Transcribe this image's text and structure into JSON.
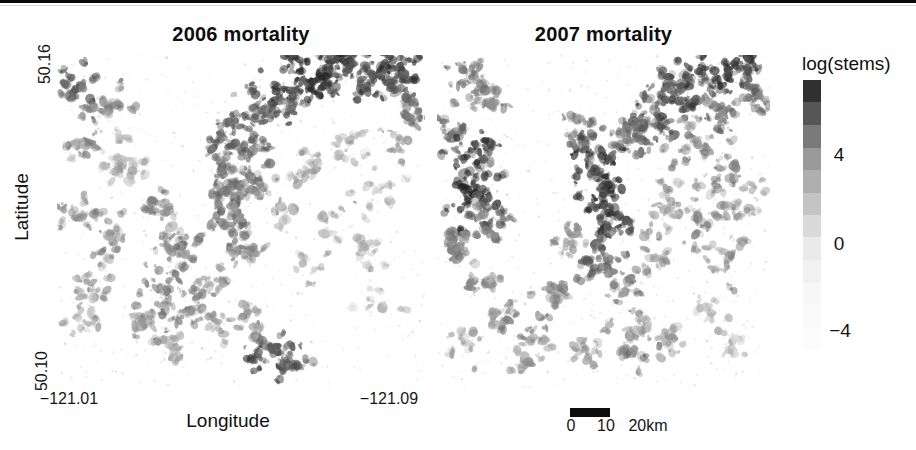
{
  "figure": {
    "panels": [
      {
        "title": "2006 mortality"
      },
      {
        "title": "2007 mortality"
      }
    ],
    "axes": {
      "y_label": "Latitude",
      "y_ticks": [
        {
          "label": "50.16"
        },
        {
          "label": "50.10"
        }
      ],
      "x_label": "Longitude",
      "x_ticks": [
        {
          "label": "−121.01"
        },
        {
          "label": "−121.09"
        }
      ]
    },
    "colorbar": {
      "title": "log(stems)",
      "ticks": [
        {
          "label": "4"
        },
        {
          "label": "0"
        },
        {
          "label": "−4"
        }
      ],
      "dark_color": "#282828",
      "light_color": "#fdfdfd"
    },
    "scalebar": {
      "labels": [
        {
          "text": "0"
        },
        {
          "text": "10"
        },
        {
          "text": "20km"
        }
      ],
      "bar_color": "#0d0d0d"
    },
    "top_rule_color": "#0b0b0b"
  },
  "chart_data": {
    "type": "heatmap",
    "subtype": "grayscale-raster-map-pair",
    "xlabel": "Longitude",
    "ylabel": "Latitude",
    "x_range": [
      -121.01,
      -121.09
    ],
    "y_range": [
      50.1,
      50.16
    ],
    "grid": false,
    "legend_position": "right",
    "colorbar": {
      "label": "log(stems)",
      "tick_values": [
        4,
        0,
        -4
      ],
      "value_range": [
        -5,
        7.5
      ],
      "high_is_dark": true,
      "steps": 12,
      "gradient_anchors": [
        [
          0,
          30
        ],
        [
          0.274,
          150
        ],
        [
          0.6,
          232
        ],
        [
          0.8,
          248
        ],
        [
          1,
          253
        ]
      ]
    },
    "scalebar": {
      "units": "km",
      "ticks": [
        0,
        10,
        20
      ],
      "filled_segment_km": [
        0,
        10
      ]
    },
    "panels": [
      {
        "title": "2006 mortality",
        "clusters": [
          [
            0.47,
            0.4,
            30,
            14,
            0.55
          ],
          [
            0.46,
            0.3,
            26,
            12,
            0.6
          ],
          [
            0.5,
            0.22,
            24,
            12,
            0.6
          ],
          [
            0.56,
            0.16,
            26,
            12,
            0.65
          ],
          [
            0.62,
            0.1,
            30,
            13,
            0.75
          ],
          [
            0.7,
            0.06,
            34,
            13,
            0.85
          ],
          [
            0.78,
            0.04,
            30,
            12,
            0.8
          ],
          [
            0.86,
            0.08,
            26,
            12,
            0.7
          ],
          [
            0.93,
            0.05,
            20,
            10,
            0.75
          ],
          [
            0.97,
            0.17,
            16,
            9,
            0.6
          ],
          [
            0.47,
            0.5,
            22,
            11,
            0.55
          ],
          [
            0.5,
            0.58,
            18,
            10,
            0.5
          ],
          [
            0.53,
            0.38,
            16,
            9,
            0.5
          ],
          [
            0.04,
            0.1,
            22,
            11,
            0.65
          ],
          [
            0.13,
            0.16,
            18,
            11,
            0.5
          ],
          [
            0.07,
            0.27,
            16,
            10,
            0.45
          ],
          [
            0.16,
            0.31,
            26,
            16,
            0.33
          ],
          [
            0.05,
            0.47,
            16,
            10,
            0.45
          ],
          [
            0.14,
            0.55,
            18,
            11,
            0.45
          ],
          [
            0.1,
            0.68,
            14,
            10,
            0.4
          ],
          [
            0.06,
            0.8,
            12,
            9,
            0.35
          ],
          [
            0.28,
            0.47,
            18,
            11,
            0.45
          ],
          [
            0.33,
            0.57,
            20,
            11,
            0.5
          ],
          [
            0.3,
            0.68,
            20,
            11,
            0.5
          ],
          [
            0.36,
            0.76,
            18,
            10,
            0.5
          ],
          [
            0.24,
            0.8,
            16,
            10,
            0.45
          ],
          [
            0.3,
            0.88,
            14,
            9,
            0.4
          ],
          [
            0.41,
            0.68,
            14,
            9,
            0.45
          ],
          [
            0.44,
            0.82,
            12,
            9,
            0.4
          ],
          [
            0.56,
            0.88,
            22,
            11,
            0.7
          ],
          [
            0.63,
            0.92,
            18,
            9,
            0.65
          ],
          [
            0.52,
            0.78,
            12,
            9,
            0.45
          ],
          [
            0.8,
            0.3,
            12,
            12,
            0.3
          ],
          [
            0.88,
            0.42,
            12,
            12,
            0.3
          ],
          [
            0.85,
            0.58,
            10,
            11,
            0.3
          ],
          [
            0.93,
            0.27,
            10,
            9,
            0.35
          ],
          [
            0.75,
            0.5,
            10,
            10,
            0.35
          ],
          [
            0.68,
            0.35,
            12,
            10,
            0.35
          ],
          [
            0.6,
            0.47,
            10,
            9,
            0.35
          ],
          [
            0.87,
            0.75,
            8,
            9,
            0.25
          ],
          [
            0.7,
            0.65,
            8,
            9,
            0.3
          ]
        ]
      },
      {
        "title": "2007 mortality",
        "clusters": [
          [
            0.08,
            0.08,
            20,
            11,
            0.55
          ],
          [
            0.16,
            0.12,
            16,
            10,
            0.5
          ],
          [
            0.04,
            0.22,
            18,
            10,
            0.55
          ],
          [
            0.13,
            0.3,
            28,
            13,
            0.75
          ],
          [
            0.1,
            0.42,
            30,
            13,
            0.8
          ],
          [
            0.16,
            0.5,
            22,
            11,
            0.6
          ],
          [
            0.06,
            0.58,
            18,
            10,
            0.55
          ],
          [
            0.12,
            0.68,
            16,
            10,
            0.45
          ],
          [
            0.2,
            0.78,
            14,
            9,
            0.45
          ],
          [
            0.08,
            0.88,
            10,
            8,
            0.35
          ],
          [
            0.44,
            0.22,
            20,
            11,
            0.6
          ],
          [
            0.47,
            0.32,
            26,
            12,
            0.75
          ],
          [
            0.5,
            0.42,
            26,
            12,
            0.8
          ],
          [
            0.52,
            0.52,
            24,
            11,
            0.75
          ],
          [
            0.48,
            0.62,
            20,
            10,
            0.6
          ],
          [
            0.55,
            0.7,
            16,
            10,
            0.5
          ],
          [
            0.4,
            0.55,
            14,
            9,
            0.45
          ],
          [
            0.58,
            0.25,
            22,
            12,
            0.6
          ],
          [
            0.65,
            0.18,
            26,
            12,
            0.65
          ],
          [
            0.72,
            0.12,
            28,
            12,
            0.7
          ],
          [
            0.8,
            0.07,
            26,
            11,
            0.75
          ],
          [
            0.9,
            0.04,
            24,
            11,
            0.8
          ],
          [
            0.96,
            0.12,
            16,
            9,
            0.6
          ],
          [
            0.85,
            0.18,
            20,
            11,
            0.55
          ],
          [
            0.75,
            0.28,
            18,
            11,
            0.5
          ],
          [
            0.85,
            0.35,
            16,
            11,
            0.45
          ],
          [
            0.92,
            0.45,
            14,
            10,
            0.4
          ],
          [
            0.8,
            0.5,
            16,
            11,
            0.45
          ],
          [
            0.88,
            0.6,
            14,
            10,
            0.4
          ],
          [
            0.7,
            0.45,
            14,
            10,
            0.4
          ],
          [
            0.65,
            0.58,
            14,
            10,
            0.45
          ],
          [
            0.3,
            0.85,
            14,
            10,
            0.45
          ],
          [
            0.25,
            0.92,
            10,
            8,
            0.4
          ],
          [
            0.45,
            0.88,
            12,
            9,
            0.4
          ],
          [
            0.58,
            0.9,
            14,
            9,
            0.5
          ],
          [
            0.68,
            0.85,
            12,
            9,
            0.4
          ],
          [
            0.35,
            0.72,
            14,
            10,
            0.45
          ],
          [
            0.6,
            0.8,
            12,
            9,
            0.4
          ],
          [
            0.82,
            0.78,
            10,
            9,
            0.3
          ],
          [
            0.9,
            0.88,
            8,
            8,
            0.25
          ]
        ]
      }
    ]
  }
}
